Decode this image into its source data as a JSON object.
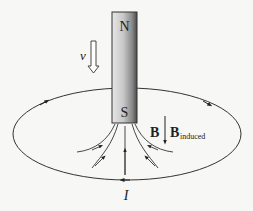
{
  "diagram": {
    "magnet": {
      "north_label": "N",
      "south_label": "S"
    },
    "velocity_label": "v",
    "field_label": "B",
    "induced_field_label": "B",
    "induced_subscript": "induced",
    "current_label": "I",
    "colors": {
      "line": "#333333",
      "background": "#f7f7f5",
      "magnet_light": "#f2f2f2",
      "magnet_dark": "#555555"
    }
  }
}
